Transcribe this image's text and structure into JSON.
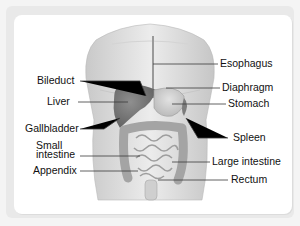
{
  "diagram": {
    "type": "anatomy-labeled",
    "labels_left": [
      {
        "id": "bileduct",
        "text": "Bileduct"
      },
      {
        "id": "liver",
        "text": "Liver"
      },
      {
        "id": "gallbladder",
        "text": "Gallbladder"
      },
      {
        "id": "small-intestine",
        "text_line1": "Small",
        "text_line2": "intestine"
      },
      {
        "id": "appendix",
        "text": "Appendix"
      }
    ],
    "labels_right": [
      {
        "id": "esophagus",
        "text": "Esophagus"
      },
      {
        "id": "diaphragm",
        "text": "Diaphragm"
      },
      {
        "id": "stomach",
        "text": "Stomach"
      },
      {
        "id": "spleen",
        "text": "Spleen"
      },
      {
        "id": "large-intestine",
        "text": "Large intestine"
      },
      {
        "id": "rectum",
        "text": "Rectum"
      }
    ],
    "colors": {
      "background": "#f4f4f4",
      "card": "#ffffff",
      "skin": "#dcdcdc",
      "organ_dark": "#8a8a8a",
      "leader_line": "#333333"
    }
  }
}
